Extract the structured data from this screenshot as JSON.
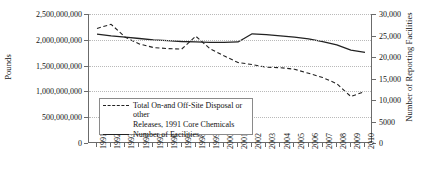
{
  "chart_data": {
    "type": "line",
    "title": "",
    "xlabel": "",
    "ylabel": "Pounds",
    "y2label": "Number of Reporting Facilities",
    "grid": true,
    "legend_position": "inside-lower-left",
    "categories": [
      "1991",
      "1992",
      "1993",
      "1994",
      "1995",
      "1996",
      "1997",
      "1998",
      "1999",
      "2000",
      "2001",
      "2002",
      "2003",
      "2004",
      "2005",
      "2006",
      "2007",
      "2008",
      "2009",
      "2010"
    ],
    "ylim": [
      0,
      2500000000
    ],
    "y2lim": [
      0,
      30000
    ],
    "yticks": [
      0,
      500000000,
      1000000000,
      1500000000,
      2000000000,
      2500000000
    ],
    "ytick_labels": [
      "0",
      "500,000,000",
      "1,000,000,000",
      "1,500,000,000",
      "2,000,000,000",
      "2,500,000,000"
    ],
    "y2ticks": [
      0,
      5000,
      10000,
      15000,
      20000,
      25000,
      30000
    ],
    "y2tick_labels": [
      "0",
      "5000",
      "10,000",
      "15,000",
      "20,000",
      "25,000",
      "30,000"
    ],
    "series": [
      {
        "name": "Total On-and Off-Site Disposal or other Releases, 1991 Core Chemicals",
        "axis": "left",
        "style": "dashed",
        "color": "#222222",
        "values": [
          2220000000,
          2300000000,
          2050000000,
          1920000000,
          1850000000,
          1830000000,
          1820000000,
          2070000000,
          1830000000,
          1690000000,
          1560000000,
          1520000000,
          1470000000,
          1460000000,
          1430000000,
          1350000000,
          1270000000,
          1150000000,
          900000000,
          1000000000
        ]
      },
      {
        "name": "Number of Facilities",
        "axis": "right",
        "style": "solid",
        "color": "#222222",
        "values": [
          25300,
          24900,
          24600,
          24300,
          24000,
          23800,
          23600,
          23500,
          23400,
          23400,
          23500,
          25400,
          25200,
          24900,
          24600,
          24200,
          23600,
          22800,
          21600,
          21100
        ]
      }
    ],
    "legend_entries": [
      {
        "label_line1": "Total On-and Off-Site Disposal or other",
        "label_line2": "Releases, 1991 Core Chemicals",
        "style": "dashed"
      },
      {
        "label_line1": "Number of Facilities",
        "label_line2": "",
        "style": "solid"
      }
    ]
  }
}
